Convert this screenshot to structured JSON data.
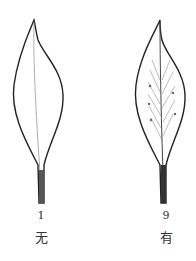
{
  "figures": [
    {
      "number": "1",
      "caption": "无",
      "variant": "plain-leaf"
    },
    {
      "number": "9",
      "caption": "有",
      "variant": "hatched-leaf"
    }
  ],
  "colors": {
    "stroke": "#222222",
    "background": "#ffffff",
    "hatch": "#777777"
  }
}
